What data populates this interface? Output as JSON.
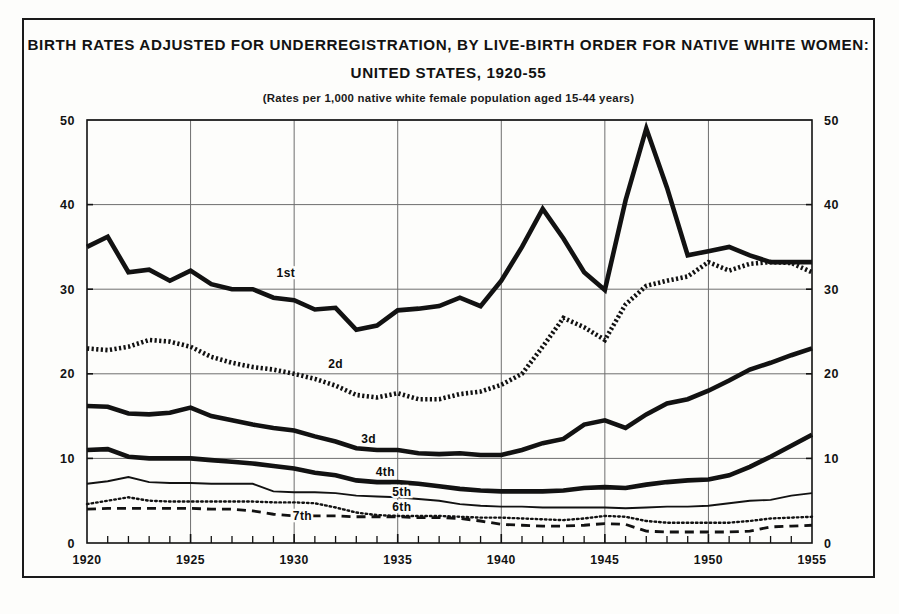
{
  "figure": {
    "title_line1": "BIRTH RATES ADJUSTED FOR UNDERREGISTRATION, BY LIVE-BIRTH ORDER FOR NATIVE WHITE WOMEN:",
    "title_line2": "UNITED STATES, 1920-55",
    "subtitle": "(Rates per 1,000 native white female population aged 15-44 years)",
    "ink_color": "#121212",
    "grid_color": "#6e6e6e",
    "background": "#fdfdfb"
  },
  "chart_data": {
    "type": "line",
    "title": "BIRTH RATES ADJUSTED FOR UNDERREGISTRATION, BY LIVE-BIRTH ORDER FOR NATIVE WHITE WOMEN: UNITED STATES, 1920-55",
    "subtitle": "(Rates per 1,000 native white female population aged 15-44 years)",
    "xlabel": "",
    "ylabel": "",
    "xlim": [
      1920,
      1955
    ],
    "ylim": [
      0,
      50
    ],
    "ytick_values": [
      0,
      10,
      20,
      30,
      40,
      50
    ],
    "ytick_labels": [
      "0",
      "10",
      "20",
      "30",
      "40",
      "50"
    ],
    "xtick_values": [
      1920,
      1925,
      1930,
      1935,
      1940,
      1945,
      1950,
      1955
    ],
    "xtick_labels": [
      "1920",
      "1925",
      "1930",
      "1935",
      "1940",
      "1945",
      "1950",
      "1955"
    ],
    "minor_xticks_every": 1,
    "grid": "horizontal-and-vertical-at-major",
    "dual_y_axis": true,
    "legend_position": "inline-labels-on-curves",
    "x": [
      1920,
      1921,
      1922,
      1923,
      1924,
      1925,
      1926,
      1927,
      1928,
      1929,
      1930,
      1931,
      1932,
      1933,
      1934,
      1935,
      1936,
      1937,
      1938,
      1939,
      1940,
      1941,
      1942,
      1943,
      1944,
      1945,
      1946,
      1947,
      1948,
      1949,
      1950,
      1951,
      1952,
      1953,
      1954,
      1955
    ],
    "series": [
      {
        "name": "1st",
        "label": "1st",
        "style": "thick-solid",
        "values": [
          35.0,
          36.2,
          32.0,
          32.3,
          31.0,
          32.2,
          30.6,
          30.0,
          30.0,
          29.0,
          28.7,
          27.6,
          27.8,
          25.2,
          25.7,
          27.5,
          27.7,
          28.0,
          29.0,
          28.0,
          31.0,
          35.0,
          39.5,
          36.0,
          32.0,
          29.9,
          40.5,
          49.0,
          42.0,
          34.0,
          34.5,
          35.0,
          34.0,
          33.2,
          33.2,
          33.2
        ]
      },
      {
        "name": "2d",
        "label": "2d",
        "style": "coarse-dotted",
        "values": [
          23.0,
          22.8,
          23.2,
          24.0,
          23.8,
          23.2,
          22.0,
          21.3,
          20.8,
          20.5,
          20.0,
          19.4,
          18.6,
          17.5,
          17.2,
          17.7,
          17.0,
          17.0,
          17.6,
          17.9,
          18.7,
          20.0,
          23.2,
          26.6,
          25.5,
          24.0,
          28.2,
          30.4,
          31.0,
          31.5,
          33.2,
          32.2,
          33.0,
          33.2,
          33.1,
          32.0
        ]
      },
      {
        "name": "3d",
        "label": "3d",
        "style": "thick-solid",
        "values": [
          16.2,
          16.1,
          15.3,
          15.2,
          15.4,
          16.0,
          15.0,
          14.5,
          14.0,
          13.6,
          13.3,
          12.6,
          12.0,
          11.2,
          11.0,
          11.0,
          10.6,
          10.5,
          10.6,
          10.4,
          10.4,
          11.0,
          11.8,
          12.3,
          14.0,
          14.5,
          13.6,
          15.2,
          16.5,
          17.0,
          18.0,
          19.2,
          20.5,
          21.3,
          22.2,
          23.0
        ]
      },
      {
        "name": "4th",
        "label": "4th",
        "style": "thick-solid",
        "values": [
          11.0,
          11.1,
          10.2,
          10.0,
          10.0,
          10.0,
          9.8,
          9.6,
          9.4,
          9.1,
          8.8,
          8.3,
          8.0,
          7.4,
          7.2,
          7.2,
          7.0,
          6.7,
          6.4,
          6.2,
          6.1,
          6.1,
          6.1,
          6.2,
          6.5,
          6.6,
          6.5,
          6.9,
          7.2,
          7.4,
          7.5,
          8.0,
          9.0,
          10.2,
          11.5,
          12.8
        ]
      },
      {
        "name": "5th",
        "label": "5th",
        "style": "thin-solid",
        "values": [
          7.0,
          7.3,
          7.8,
          7.2,
          7.1,
          7.1,
          7.0,
          7.0,
          7.0,
          6.1,
          6.0,
          6.0,
          5.9,
          5.6,
          5.5,
          5.4,
          5.2,
          5.0,
          4.6,
          4.4,
          4.3,
          4.3,
          4.2,
          4.2,
          4.2,
          4.2,
          4.1,
          4.2,
          4.3,
          4.3,
          4.4,
          4.7,
          5.0,
          5.1,
          5.6,
          5.9
        ]
      },
      {
        "name": "6th",
        "label": "6th",
        "style": "fine-dotted",
        "values": [
          4.6,
          5.0,
          5.4,
          5.0,
          4.9,
          4.9,
          4.9,
          4.9,
          4.9,
          4.8,
          4.8,
          4.7,
          4.2,
          3.6,
          3.3,
          3.2,
          3.2,
          3.2,
          3.1,
          3.0,
          3.0,
          2.9,
          2.8,
          2.7,
          2.9,
          3.2,
          3.1,
          2.6,
          2.4,
          2.4,
          2.4,
          2.4,
          2.6,
          2.9,
          3.0,
          3.1
        ]
      },
      {
        "name": "7th",
        "label": "7th",
        "style": "dashed",
        "values": [
          4.0,
          4.1,
          4.1,
          4.1,
          4.1,
          4.1,
          4.0,
          4.0,
          3.8,
          3.4,
          3.2,
          3.2,
          3.2,
          3.1,
          3.1,
          3.1,
          3.0,
          3.0,
          2.9,
          2.6,
          2.2,
          2.1,
          2.0,
          2.0,
          2.1,
          2.3,
          2.2,
          1.4,
          1.3,
          1.3,
          1.3,
          1.3,
          1.4,
          1.9,
          2.0,
          2.1
        ]
      }
    ]
  },
  "series_label_positions": [
    {
      "label": "1st",
      "x": 1929.6,
      "y": 31.4
    },
    {
      "label": "2d",
      "x": 1932.0,
      "y": 20.7
    },
    {
      "label": "3d",
      "x": 1933.6,
      "y": 11.8
    },
    {
      "label": "4th",
      "x": 1934.4,
      "y": 7.9
    },
    {
      "label": "5th",
      "x": 1935.2,
      "y": 5.6
    },
    {
      "label": "6th",
      "x": 1935.2,
      "y": 3.8
    },
    {
      "label": "7th",
      "x": 1930.4,
      "y": 2.7
    }
  ]
}
